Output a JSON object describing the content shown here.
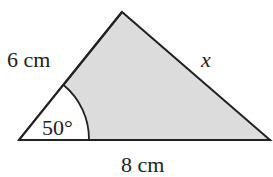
{
  "diagram": {
    "type": "triangle",
    "fill_color": "#dcdcdc",
    "stroke_color": "#222222",
    "vertices": {
      "apex": [
        122,
        12
      ],
      "bottom_left": [
        19,
        140
      ],
      "bottom_right": [
        270,
        140
      ]
    },
    "labels": {
      "left_side": "6 cm",
      "right_side": "x",
      "base": "8 cm",
      "angle": "50°"
    }
  }
}
